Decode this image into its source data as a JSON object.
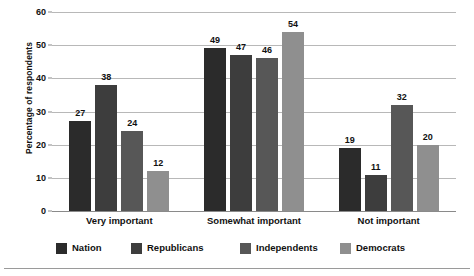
{
  "chart_data": {
    "type": "bar",
    "title": "",
    "xlabel": "",
    "ylabel": "Percentage of respondents",
    "ylim": [
      0,
      60
    ],
    "yticks": [
      0,
      10,
      20,
      30,
      40,
      50,
      60
    ],
    "grid": true,
    "legend_position": "bottom",
    "categories": [
      "Very important",
      "Somewhat important",
      "Not important"
    ],
    "series": [
      {
        "name": "Nation",
        "color": "#2b2b2b",
        "values": [
          27,
          49,
          19
        ]
      },
      {
        "name": "Republicans",
        "color": "#3d3d3d",
        "values": [
          38,
          47,
          11
        ]
      },
      {
        "name": "Independents",
        "color": "#575757",
        "values": [
          24,
          46,
          32
        ]
      },
      {
        "name": "Democrats",
        "color": "#8f8f8f",
        "values": [
          12,
          54,
          20
        ]
      }
    ]
  },
  "axis": {
    "y_title": "Percentage of respondents",
    "y_tick_labels": [
      "0",
      "10",
      "20",
      "30",
      "40",
      "50",
      "60"
    ]
  },
  "values": {
    "very_important": {
      "nation": "27",
      "republicans": "38",
      "independents": "24",
      "democrats": "12"
    },
    "somewhat_important": {
      "nation": "49",
      "republicans": "47",
      "independents": "46",
      "democrats": "54"
    },
    "not_important": {
      "nation": "19",
      "republicans": "11",
      "independents": "32",
      "democrats": "20"
    }
  },
  "x_labels": [
    "Very important",
    "Somewhat important",
    "Not important"
  ],
  "legend": {
    "items": [
      {
        "label": "Nation",
        "color": "#2b2b2b"
      },
      {
        "label": "Republicans",
        "color": "#3d3d3d"
      },
      {
        "label": "Independents",
        "color": "#575757"
      },
      {
        "label": "Democrats",
        "color": "#8f8f8f"
      }
    ]
  }
}
